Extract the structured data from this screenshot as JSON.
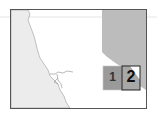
{
  "map": {
    "colors": {
      "background": "#ffffff",
      "land_left": "#ececec",
      "region_right": "#bcbcbc",
      "box1_fill": "#9a9a9a",
      "box2_fill": "#a8a8a8",
      "frame": "#555555",
      "coast": "#8a8a8a"
    },
    "boxes": [
      {
        "id": "1",
        "label": "1"
      },
      {
        "id": "2",
        "label": "2"
      }
    ]
  }
}
